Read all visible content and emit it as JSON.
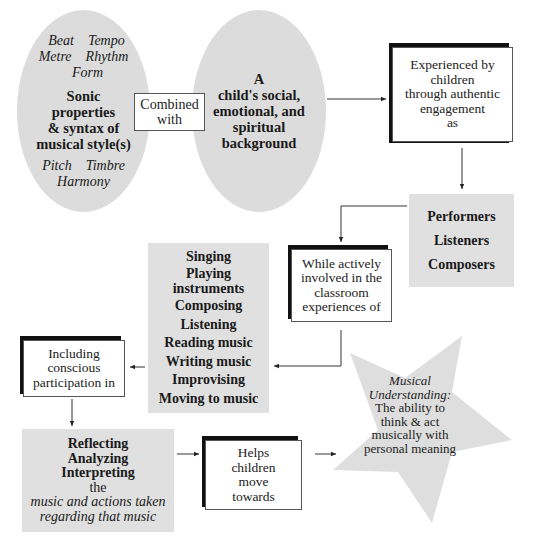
{
  "diagram": {
    "sonic_ellipse": {
      "elements_row1": [
        "Beat",
        "Tempo"
      ],
      "elements_row2": [
        "Metre",
        "Rhythm"
      ],
      "elements_row3": "Form",
      "title_lines": [
        "Sonic",
        "properties",
        "& syntax of",
        "musical style(s)"
      ],
      "elements_row4": [
        "Pitch",
        "Timbre"
      ],
      "elements_row5": "Harmony"
    },
    "combined_box": {
      "lines": [
        "Combined",
        "with"
      ]
    },
    "background_ellipse": {
      "lines": [
        "A",
        "child's social,",
        "emotional, and",
        "spiritual",
        "background"
      ]
    },
    "experienced_box": {
      "lines": [
        "Experienced by",
        "children",
        "through authentic",
        "engagement",
        "as"
      ]
    },
    "roles_box": {
      "items": [
        "Performers",
        "Listeners",
        "Composers"
      ]
    },
    "while_box": {
      "lines": [
        "While actively",
        "involved in the",
        "classroom",
        "experiences of"
      ]
    },
    "activities_box": {
      "items": [
        "Singing",
        "Playing",
        "instruments",
        "Composing",
        "Listening",
        "Reading music",
        "Writing music",
        "Improvising",
        "Moving to music"
      ]
    },
    "including_box": {
      "lines": [
        "Including",
        "conscious",
        "participation in"
      ]
    },
    "reflecting_box": {
      "bold_lines": [
        "Reflecting",
        "Analyzing",
        "Interpreting"
      ],
      "plain_line": "the",
      "italic_lines": [
        "music and actions taken",
        "regarding that music"
      ]
    },
    "helps_box": {
      "lines": [
        "Helps",
        "children",
        "move",
        "towards"
      ]
    },
    "goal_star": {
      "italic_lines": [
        "Musical",
        "Understanding:"
      ],
      "lines": [
        "The ability to",
        "think & act",
        "musically with",
        "personal meaning"
      ]
    },
    "colors": {
      "shape_fill": "#dcdcdc",
      "box_shadow": "#111111",
      "line": "#333333"
    }
  }
}
